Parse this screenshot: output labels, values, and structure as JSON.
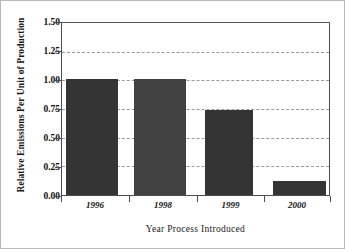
{
  "chart_data": {
    "type": "bar",
    "title": "",
    "subtitle": "",
    "xlabel": "Year Process Introduced",
    "ylabel": "Relative Emissions Per Unit of Production",
    "categories": [
      "1996",
      "1998",
      "1999",
      "2000"
    ],
    "values": [
      1.01,
      1.01,
      0.74,
      0.12
    ],
    "series": [
      {
        "name": "Relative Emissions Per Unit of Production",
        "values": [
          1.01,
          1.01,
          0.74,
          0.12
        ]
      }
    ],
    "ylim": [
      0.0,
      1.5
    ],
    "ytick_values": [
      1.5,
      1.25,
      1.0,
      0.75,
      0.5,
      0.25,
      0.0
    ],
    "ytick_labels": [
      "1.50",
      "1.25",
      "1.00",
      "0.75",
      "0.50",
      "0.25",
      "0.00"
    ],
    "xtick_labels": [
      "1996",
      "1998",
      "1999",
      "2000"
    ],
    "grid": "horizontal-dashed",
    "legend": "none",
    "annotations": [],
    "colors": {
      "bar": "#343434",
      "bar_alt": "#414141",
      "gridline": "#9a9a9a",
      "axis": "#4d4d4d",
      "text": "#101010",
      "background": "#ffffff"
    }
  }
}
